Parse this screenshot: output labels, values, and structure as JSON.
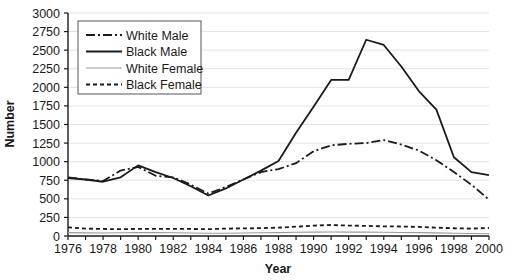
{
  "chart_data": {
    "type": "line",
    "title": "",
    "xlabel": "Year",
    "ylabel": "Number",
    "xlim": [
      1976,
      2000
    ],
    "ylim": [
      0,
      3000
    ],
    "ytick_step": 250,
    "xtick_step": 1,
    "xtick_label_step": 2,
    "grid": true,
    "legend_position": "top-left",
    "x": [
      1976,
      1977,
      1978,
      1979,
      1980,
      1981,
      1982,
      1983,
      1984,
      1985,
      1986,
      1987,
      1988,
      1989,
      1990,
      1991,
      1992,
      1993,
      1994,
      1995,
      1996,
      1997,
      1998,
      1999,
      2000
    ],
    "xtick_labels": [
      "1976",
      "1977",
      "1978",
      "1979",
      "1980",
      "1981",
      "1982",
      "1983",
      "1984",
      "1985",
      "1986",
      "1987",
      "1988",
      "1989",
      "1990",
      "1991",
      "1992",
      "1993",
      "1994",
      "1995",
      "1996",
      "1997",
      "1998",
      "1999",
      "2000"
    ],
    "xtick_labels_shown": [
      "1976",
      "1978",
      "1980",
      "1982",
      "1984",
      "1986",
      "1988",
      "1990",
      "1992",
      "1994",
      "1996",
      "1998",
      "2000"
    ],
    "ytick_labels": [
      "0",
      "250",
      "500",
      "750",
      "1000",
      "1250",
      "1500",
      "1750",
      "2000",
      "2250",
      "2500",
      "2750",
      "3000"
    ],
    "series": [
      {
        "name": "White Male",
        "style": "dash-dot",
        "color": "#1a1a1a",
        "width": 1.8,
        "dasharray": "9,3,2,3",
        "values": [
          790,
          760,
          740,
          880,
          930,
          810,
          790,
          690,
          570,
          660,
          760,
          860,
          900,
          980,
          1140,
          1220,
          1240,
          1250,
          1290,
          1230,
          1150,
          1020,
          860,
          690,
          490
        ]
      },
      {
        "name": "Black Male",
        "style": "solid",
        "color": "#1a1a1a",
        "width": 1.8,
        "dasharray": "",
        "values": [
          780,
          760,
          730,
          790,
          950,
          860,
          780,
          670,
          545,
          640,
          760,
          880,
          1010,
          1390,
          1740,
          2100,
          2100,
          2640,
          2570,
          2280,
          1950,
          1700,
          1060,
          860,
          820
        ]
      },
      {
        "name": "White Female",
        "style": "thin-solid",
        "color": "#9a9a9a",
        "width": 1.1,
        "dasharray": "",
        "values": [
          45,
          42,
          40,
          44,
          48,
          46,
          43,
          40,
          36,
          38,
          40,
          44,
          46,
          50,
          52,
          54,
          52,
          52,
          50,
          48,
          46,
          42,
          38,
          34,
          30
        ]
      },
      {
        "name": "Black Female",
        "style": "dotted",
        "color": "#1a1a1a",
        "width": 1.8,
        "dasharray": "4,3",
        "values": [
          115,
          100,
          95,
          92,
          96,
          95,
          96,
          95,
          92,
          100,
          102,
          106,
          112,
          125,
          140,
          148,
          140,
          136,
          130,
          128,
          122,
          112,
          104,
          100,
          108
        ]
      }
    ]
  }
}
